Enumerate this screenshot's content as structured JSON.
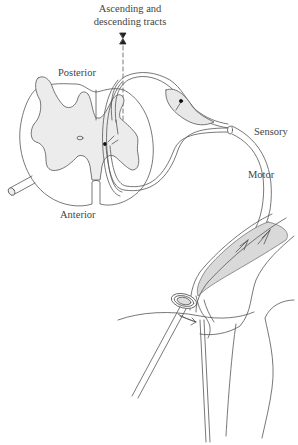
{
  "diagram": {
    "type": "anatomical reflex arc illustration (spinal cord cross-section with sensory and motor neurons to knee muscle/tendon)",
    "labels": {
      "tracts_line1": "Ascending and",
      "tracts_line2": "descending tracts",
      "posterior": "Posterior",
      "anterior": "Anterior",
      "sensory": "Sensory",
      "motor": "Motor"
    },
    "colors": {
      "line": "#555555",
      "gray_matter_fill": "#ececec",
      "muscle_fill": "#d9d9d9",
      "text": "#444444",
      "background": "#ffffff"
    }
  }
}
